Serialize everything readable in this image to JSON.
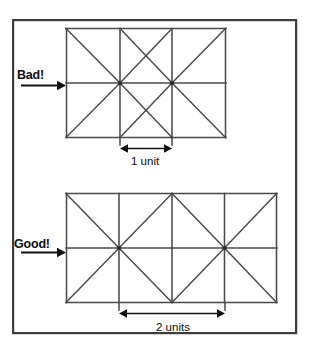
{
  "figure": {
    "kind": "mesh-quality-illustration",
    "caption_labels": {
      "bad": "Bad!",
      "good": "Good!"
    },
    "dimension_labels": {
      "top": "1 unit",
      "bottom": "2 units"
    },
    "colors": {
      "background": "#ffffff",
      "frame_stroke": "#3c3c3c",
      "mesh_stroke": "#4a4a4a",
      "annotation_stroke": "#111111",
      "text": "#0d0d0d"
    },
    "frame": {
      "x": 12,
      "y": 19,
      "width": 285,
      "height": 315
    },
    "meshes": [
      {
        "id": "top-mesh",
        "quality": "Bad!",
        "x": 66,
        "y": 28,
        "width": 160,
        "height": 110,
        "columns": 4,
        "rows": 2,
        "cell_width_units": 1,
        "cell_height_units": 1.375,
        "aspect_note": "tall narrow cells",
        "pinwheel_node_columns": [
          1,
          2
        ],
        "dimension_span_columns": [
          1,
          2
        ],
        "dimension_label": "1 unit"
      },
      {
        "id": "bottom-mesh",
        "quality": "Good!",
        "x": 66,
        "y": 193,
        "width": 211,
        "height": 110,
        "columns": 4,
        "rows": 2,
        "cell_width_units": 2,
        "cell_height_units": 1.04,
        "aspect_note": "near-square cells",
        "pinwheel_node_columns": [
          1,
          3
        ],
        "dimension_span_columns": [
          1,
          3
        ],
        "dimension_label": "2 units"
      }
    ],
    "leaders": [
      {
        "id": "bad-leader",
        "label": "Bad!",
        "x1": 21,
        "x2": 63,
        "y": 85
      },
      {
        "id": "good-leader",
        "label": "Good!",
        "x1": 21,
        "x2": 63,
        "y": 252
      }
    ],
    "dimension_arrows": [
      {
        "id": "top-dimension",
        "x1": 120,
        "x2": 172,
        "y": 148,
        "label": "1 unit"
      },
      {
        "id": "bottom-dimension",
        "x1": 119,
        "x2": 225,
        "y": 313,
        "label": "2 units"
      }
    ]
  }
}
